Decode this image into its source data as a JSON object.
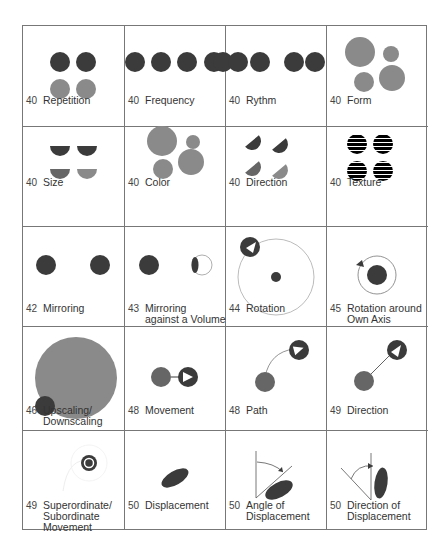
{
  "colors": {
    "dark": "#3b3b3b",
    "gray": "#8a8a8a",
    "line": "#777777",
    "thin": "#999999"
  },
  "cells": [
    {
      "num": "40",
      "label": [
        "Repetition"
      ]
    },
    {
      "num": "40",
      "label": [
        "Frequency"
      ]
    },
    {
      "num": "40",
      "label": [
        "Rythm"
      ]
    },
    {
      "num": "40",
      "label": [
        "Form"
      ]
    },
    {
      "num": "40",
      "label": [
        "Size"
      ]
    },
    {
      "num": "40",
      "label": [
        "Color"
      ]
    },
    {
      "num": "40",
      "label": [
        "Direction"
      ]
    },
    {
      "num": "40",
      "label": [
        "Texture"
      ]
    },
    {
      "num": "42",
      "label": [
        "Mirroring"
      ]
    },
    {
      "num": "43",
      "label": [
        "Mirroring",
        "against a Volume"
      ]
    },
    {
      "num": "44",
      "label": [
        "Rotation"
      ]
    },
    {
      "num": "45",
      "label": [
        "Rotation around",
        "Own Axis"
      ]
    },
    {
      "num": "46",
      "label": [
        "Upscaling/",
        "Downscaling"
      ]
    },
    {
      "num": "48",
      "label": [
        "Movement"
      ]
    },
    {
      "num": "48",
      "label": [
        "Path"
      ]
    },
    {
      "num": "49",
      "label": [
        "Direction"
      ]
    },
    {
      "num": "49",
      "label": [
        "Superordinate/",
        "Subordinate",
        "Movement"
      ]
    },
    {
      "num": "50",
      "label": [
        "Displacement"
      ]
    },
    {
      "num": "50",
      "label": [
        "Angle of",
        "Displacement"
      ]
    },
    {
      "num": "50",
      "label": [
        "Direction of",
        "Displacement"
      ]
    }
  ]
}
